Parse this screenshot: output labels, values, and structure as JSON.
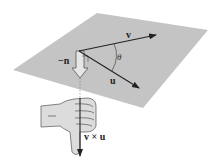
{
  "figure": {
    "labels": {
      "v": "v",
      "u": "u",
      "theta": "θ",
      "neg_n": "−n",
      "cross": "v × u"
    },
    "colors": {
      "plane": "#c4c4c4",
      "arrow": "#222222",
      "hand": "#d8d8d8"
    }
  }
}
